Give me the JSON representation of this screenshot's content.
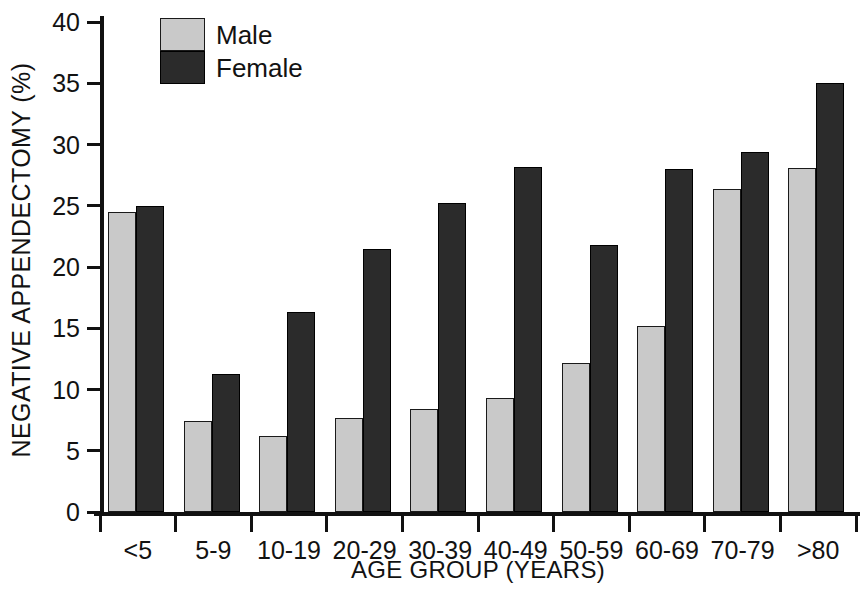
{
  "chart_data": {
    "type": "bar",
    "title": "",
    "xlabel": "AGE GROUP (YEARS)",
    "ylabel": "NEGATIVE APPENDECTOMY (%)",
    "ylim": [
      0,
      40
    ],
    "yticks": [
      0,
      5,
      10,
      15,
      20,
      25,
      30,
      35,
      40
    ],
    "ytick_labels": [
      "0",
      "5",
      "10",
      "15",
      "20",
      "25",
      "30",
      "35",
      "40"
    ],
    "grid": false,
    "legend_position": "top-left-inside",
    "categories": [
      "<5",
      "5-9",
      "10-19",
      "20-29",
      "30-39",
      "40-49",
      "50-59",
      "60-69",
      "70-79",
      ">80"
    ],
    "series": [
      {
        "name": "Male",
        "color": "#c9c9c9",
        "values": [
          24.5,
          7.4,
          6.2,
          7.7,
          8.4,
          9.3,
          12.2,
          15.2,
          26.4,
          28.1
        ]
      },
      {
        "name": "Female",
        "color": "#2b2b2b",
        "values": [
          25.0,
          11.3,
          16.3,
          21.5,
          25.2,
          28.2,
          21.8,
          28.0,
          29.4,
          35.0
        ]
      }
    ]
  },
  "legend": {
    "items": [
      {
        "label": "Male",
        "swatch": "male-swatch"
      },
      {
        "label": "Female",
        "swatch": "female-swatch"
      }
    ]
  }
}
